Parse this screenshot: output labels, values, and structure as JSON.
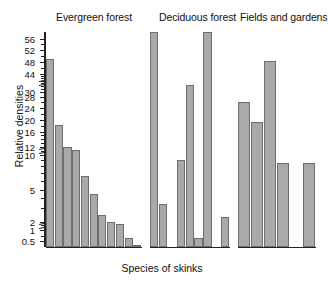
{
  "chart_data": {
    "type": "bar",
    "title": "",
    "xlabel": "Species of skinks",
    "ylabel": "Relative densities",
    "scale": "log-with-axis-breaks",
    "grid": false,
    "legend": "none",
    "ytick_labels": [
      "0.5",
      "1",
      "2",
      "5",
      "10",
      "12",
      "16",
      "20",
      "24",
      "28",
      "30",
      "44",
      "48",
      "52",
      "56"
    ],
    "axis_breaks": [
      {
        "between": [
          "2",
          "1"
        ]
      },
      {
        "between": [
          "12",
          "10"
        ]
      },
      {
        "between": [
          "44",
          "30"
        ]
      }
    ],
    "ylim": [
      0.3,
      60
    ],
    "panels": [
      {
        "name": "Evergreen forest",
        "title": "Evergreen forest",
        "values": [
          48,
          17,
          11,
          10.3,
          6.2,
          4,
          2.2,
          1.5,
          1.2,
          0.5,
          0.3
        ]
      },
      {
        "name": "Deciduous forest",
        "title": "Deciduous forest",
        "values": [
          62,
          3,
          0,
          8.5,
          32,
          0.5,
          0.25,
          0,
          2.1
        ]
      },
      {
        "name": "Fields and gardens",
        "title": "Fields and gardens",
        "values": [
          25,
          18,
          47,
          8,
          0,
          8
        ]
      }
    ],
    "colors": {
      "bar_fill": "#a9a9a9",
      "bar_stroke": "#6e6e6e",
      "axis": "#222222",
      "text": "#111111",
      "background": "#ffffff"
    }
  }
}
